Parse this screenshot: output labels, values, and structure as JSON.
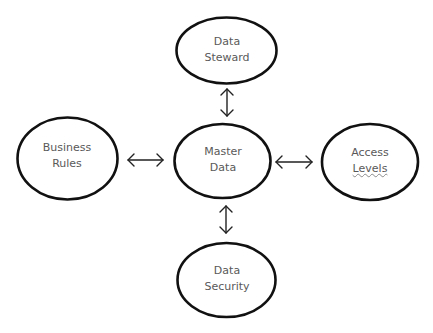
{
  "diagram": {
    "type": "hub-and-spoke",
    "stroke_color": "#111111",
    "text_color": "#595959",
    "nodes": {
      "center": {
        "line1": "Master",
        "line2": "Data"
      },
      "top": {
        "line1": "Data",
        "line2": "Steward"
      },
      "left": {
        "line1": "Business",
        "line2": "Rules"
      },
      "right": {
        "line1": "Access",
        "line2": "Levels"
      },
      "bottom": {
        "line1": "Data",
        "line2": "Security"
      }
    },
    "edges": [
      {
        "from": "center",
        "to": "top",
        "style": "bidirectional-arrow"
      },
      {
        "from": "center",
        "to": "left",
        "style": "bidirectional-arrow"
      },
      {
        "from": "center",
        "to": "right",
        "style": "bidirectional-arrow"
      },
      {
        "from": "center",
        "to": "bottom",
        "style": "bidirectional-arrow"
      }
    ]
  }
}
